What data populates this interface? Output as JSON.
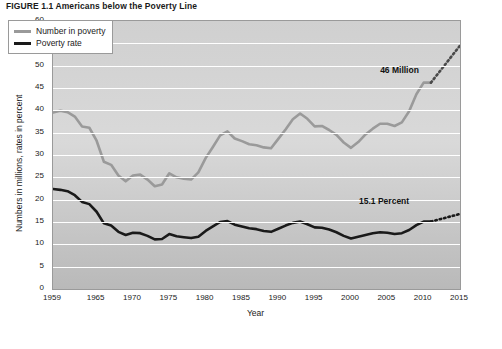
{
  "figure": {
    "title": "FIGURE 1.1  Americans below the Poverty Line"
  },
  "legend": {
    "position": "top-left",
    "items": [
      {
        "label": "Number in poverty",
        "color": "#9a9a9a"
      },
      {
        "label": "Poverty rate",
        "color": "#1a1a1a"
      }
    ]
  },
  "annotations": [
    {
      "text": "46 Million",
      "x": 2008,
      "y": 48.5
    },
    {
      "text": "15.1 Percent",
      "x": 2004,
      "y": 19.2
    }
  ],
  "chart_data": {
    "type": "line",
    "title": "FIGURE 1.1  Americans below the Poverty Line",
    "xlabel": "Year",
    "ylabel": "Numbers in millions, rates in percent",
    "xlim": [
      1959,
      2015
    ],
    "ylim": [
      0,
      60
    ],
    "yticks": [
      0,
      5,
      10,
      15,
      20,
      25,
      30,
      35,
      40,
      45,
      50,
      55,
      60
    ],
    "xticks": [
      1959,
      1965,
      1970,
      1975,
      1980,
      1985,
      1990,
      1995,
      2000,
      2005,
      2010,
      2015
    ],
    "grid": "horizontal",
    "series": [
      {
        "name": "Number in poverty",
        "color": "#9a9a9a",
        "unit": "millions",
        "x": [
          1959,
          1960,
          1961,
          1962,
          1963,
          1964,
          1965,
          1966,
          1967,
          1968,
          1969,
          1970,
          1971,
          1972,
          1973,
          1974,
          1975,
          1976,
          1977,
          1978,
          1979,
          1980,
          1981,
          1982,
          1983,
          1984,
          1985,
          1986,
          1987,
          1988,
          1989,
          1990,
          1991,
          1992,
          1993,
          1994,
          1995,
          1996,
          1997,
          1998,
          1999,
          2000,
          2001,
          2002,
          2003,
          2004,
          2005,
          2006,
          2007,
          2008,
          2009,
          2010,
          2011
        ],
        "values": [
          39.5,
          39.9,
          39.6,
          38.6,
          36.4,
          36.1,
          33.2,
          28.5,
          27.8,
          25.4,
          24.1,
          25.4,
          25.6,
          24.5,
          23.0,
          23.4,
          25.9,
          25.0,
          24.7,
          24.5,
          26.1,
          29.3,
          31.8,
          34.4,
          35.3,
          33.7,
          33.1,
          32.4,
          32.2,
          31.7,
          31.5,
          33.6,
          35.7,
          38.0,
          39.3,
          38.1,
          36.4,
          36.5,
          35.6,
          34.5,
          32.8,
          31.6,
          32.9,
          34.6,
          35.9,
          37.0,
          37.0,
          36.5,
          37.3,
          39.8,
          43.6,
          46.2,
          46.2
        ]
      },
      {
        "name": "Poverty rate",
        "color": "#1a1a1a",
        "unit": "percent",
        "x": [
          1959,
          1960,
          1961,
          1962,
          1963,
          1964,
          1965,
          1966,
          1967,
          1968,
          1969,
          1970,
          1971,
          1972,
          1973,
          1974,
          1975,
          1976,
          1977,
          1978,
          1979,
          1980,
          1981,
          1982,
          1983,
          1984,
          1985,
          1986,
          1987,
          1988,
          1989,
          1990,
          1991,
          1992,
          1993,
          1994,
          1995,
          1996,
          1997,
          1998,
          1999,
          2000,
          2001,
          2002,
          2003,
          2004,
          2005,
          2006,
          2007,
          2008,
          2009,
          2010,
          2011
        ],
        "values": [
          22.4,
          22.2,
          21.9,
          21.0,
          19.5,
          19.0,
          17.3,
          14.7,
          14.2,
          12.8,
          12.1,
          12.6,
          12.5,
          11.9,
          11.1,
          11.2,
          12.3,
          11.8,
          11.6,
          11.4,
          11.7,
          13.0,
          14.0,
          15.0,
          15.2,
          14.4,
          14.0,
          13.6,
          13.4,
          13.0,
          12.8,
          13.5,
          14.2,
          14.8,
          15.1,
          14.5,
          13.8,
          13.7,
          13.3,
          12.7,
          11.9,
          11.3,
          11.7,
          12.1,
          12.5,
          12.7,
          12.6,
          12.3,
          12.5,
          13.2,
          14.3,
          15.1,
          15.1
        ]
      }
    ],
    "projection": {
      "style": "dotted",
      "series": [
        {
          "name": "Number in poverty",
          "color": "#4a4a4a",
          "x": [
            2011,
            2015
          ],
          "values": [
            46.2,
            54.5
          ]
        },
        {
          "name": "Poverty rate",
          "color": "#1a1a1a",
          "x": [
            2011,
            2015
          ],
          "values": [
            15.1,
            16.8
          ]
        }
      ]
    }
  }
}
